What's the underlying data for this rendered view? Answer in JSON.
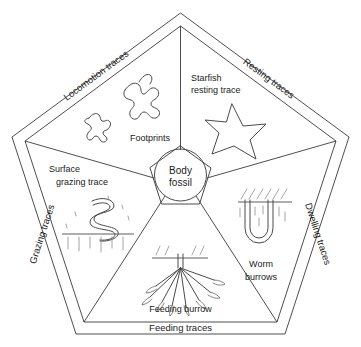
{
  "diagram": {
    "center": {
      "label_line1": "Body",
      "label_line2": "fossil",
      "name": "body-fossil-core"
    },
    "categories": [
      {
        "id": "locomotion",
        "label": "Locomotion traces",
        "position": "upper-left-edge"
      },
      {
        "id": "resting",
        "label": "Resting traces",
        "position": "upper-right-edge"
      },
      {
        "id": "dwelling",
        "label": "Dwelling traces",
        "position": "right-edge"
      },
      {
        "id": "feeding",
        "label": "Feeding traces",
        "position": "bottom-edge"
      },
      {
        "id": "grazing",
        "label": "Grazing traces",
        "position": "left-edge"
      }
    ],
    "items": [
      {
        "id": "footprints",
        "label": "Footprints",
        "label_line1": "Footprints",
        "label_line2": "",
        "icon": "footprint-blobs-icon",
        "sector": "locomotion"
      },
      {
        "id": "starfish-resting-trace",
        "label": "Starfish resting trace",
        "label_line1": "Starfish",
        "label_line2": "resting trace",
        "icon": "starfish-icon",
        "sector": "resting"
      },
      {
        "id": "worm-burrows",
        "label": "Worm burrows",
        "label_line1": "Worm",
        "label_line2": "burrows",
        "icon": "u-tube-burrow-icon",
        "sector": "dwelling"
      },
      {
        "id": "feeding-burrow",
        "label": "Feeding burrow",
        "label_line1": "Feeding burrow",
        "label_line2": "",
        "icon": "branching-burrow-icon",
        "sector": "feeding"
      },
      {
        "id": "surface-grazing-trace",
        "label": "Surface grazing trace",
        "label_line1": "Surface",
        "label_line2": "grazing trace",
        "icon": "meander-trace-icon",
        "sector": "grazing"
      }
    ],
    "colors": {
      "background": "#ffffff",
      "line": "#3a3a3a",
      "shape": "#4a4a4a",
      "hatch": "#8e8e8e",
      "text": "#1a1a1a"
    }
  }
}
